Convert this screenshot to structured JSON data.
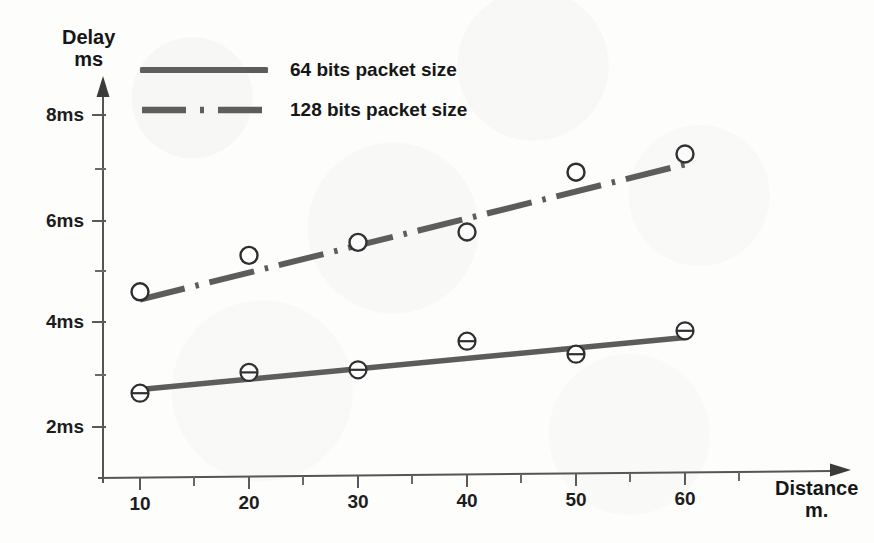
{
  "chart_data": {
    "type": "line",
    "title": "",
    "subtitle": "",
    "xlabel": "Distance m.",
    "ylabel": "Delay ms",
    "xlabel_line1": "Distance",
    "xlabel_line2": "m.",
    "ylabel_line1": "Delay",
    "ylabel_line2": "ms",
    "x": [
      10,
      20,
      30,
      40,
      50,
      60
    ],
    "xtick_labels": [
      "10",
      "20",
      "30",
      "40",
      "50",
      "60"
    ],
    "ytick_labels": [
      "2ms",
      "4ms",
      "6ms",
      "8ms"
    ],
    "ytick_values": [
      2,
      4,
      6,
      8
    ],
    "yminor_values": [
      3,
      5,
      7
    ],
    "xlim": [
      5,
      67
    ],
    "ylim": [
      1.3,
      8.6
    ],
    "grid": false,
    "legend_position": "top-left",
    "series": [
      {
        "name": "64 bits packet size",
        "style": "solid",
        "marker": "circle-barred",
        "values": [
          2.65,
          3.05,
          3.1,
          3.65,
          3.4,
          3.85
        ],
        "fit_start": 2.72,
        "fit_end": 3.72
      },
      {
        "name": "128 bits packet size",
        "style": "dash-dot",
        "marker": "circle-open",
        "values": [
          4.6,
          5.3,
          5.55,
          5.75,
          6.9,
          7.25
        ],
        "fit_start": 4.45,
        "fit_end": 7.05
      }
    ]
  },
  "legend": {
    "items": [
      {
        "label": "64 bits packet size",
        "style": "solid"
      },
      {
        "label": "128 bits packet size",
        "style": "dash-dot"
      }
    ]
  },
  "axes": {
    "y_title_line1": "Delay",
    "y_title_line2": "ms",
    "x_title_line1": "Distance",
    "x_title_line2": "m.",
    "y_labels": [
      "8ms",
      "6ms",
      "4ms",
      "2ms"
    ],
    "x_labels": [
      "10",
      "20",
      "30",
      "40",
      "50",
      "60"
    ]
  },
  "colors": {
    "ink": "#5c5c5c",
    "marker_stroke": "#2e2e2e",
    "text": "#161616",
    "paper": "#fdfdfc"
  }
}
